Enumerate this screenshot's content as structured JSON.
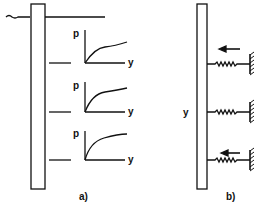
{
  "figure": {
    "panel_a": {
      "label": "a)",
      "curves": [
        {
          "p_label": "p",
          "y_label": "y"
        },
        {
          "p_label": "p",
          "y_label": "y"
        },
        {
          "p_label": "p",
          "y_label": "y"
        }
      ]
    },
    "panel_b": {
      "label": "b)",
      "axis_label": "y",
      "springs": 3,
      "arrows": 2
    },
    "colors": {
      "ink": "#111111",
      "background": "#ffffff"
    }
  }
}
